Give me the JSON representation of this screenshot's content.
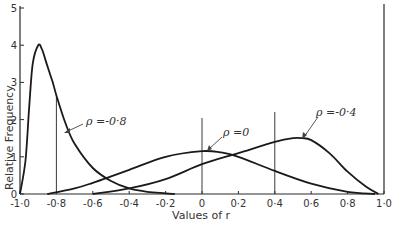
{
  "chart_data": {
    "type": "line",
    "title": "",
    "xlabel": "Values of r",
    "ylabel": "Relative  Frequency",
    "xlim": [
      -1.0,
      1.0
    ],
    "ylim": [
      0,
      5
    ],
    "grid": false,
    "legend": "none (curves annotated with arrows)",
    "x_ticks": [
      "-1·0",
      "-0·8",
      "-0·6",
      "-0·4",
      "-0·2",
      "0",
      "0·2",
      "0·4",
      "0·6",
      "0·8",
      "1·0"
    ],
    "y_ticks": [
      "0",
      "1",
      "2",
      "3",
      "4",
      "5"
    ],
    "vertical_markers": [
      -0.8,
      0.0,
      0.4
    ],
    "series": [
      {
        "name": "ρ = -0·8",
        "x": [
          -1.0,
          -0.97,
          -0.95,
          -0.93,
          -0.9,
          -0.88,
          -0.86,
          -0.84,
          -0.82,
          -0.8,
          -0.75,
          -0.7,
          -0.6,
          -0.5,
          -0.4,
          -0.3,
          -0.2,
          -0.15
        ],
        "y": [
          0.0,
          0.9,
          2.3,
          3.5,
          4.0,
          3.9,
          3.6,
          3.3,
          3.0,
          2.65,
          1.9,
          1.35,
          0.7,
          0.35,
          0.15,
          0.06,
          0.02,
          0.0
        ]
      },
      {
        "name": "ρ = 0",
        "x": [
          -0.85,
          -0.7,
          -0.6,
          -0.4,
          -0.2,
          0.0,
          0.1,
          0.2,
          0.4,
          0.6,
          0.8,
          0.95
        ],
        "y": [
          0.0,
          0.15,
          0.3,
          0.65,
          1.0,
          1.15,
          1.12,
          1.0,
          0.62,
          0.28,
          0.06,
          0.0
        ]
      },
      {
        "name": "ρ = -0·4",
        "x": [
          -0.6,
          -0.4,
          -0.2,
          0.0,
          0.2,
          0.4,
          0.5,
          0.55,
          0.6,
          0.7,
          0.8,
          0.9,
          0.97
        ],
        "y": [
          0.0,
          0.15,
          0.4,
          0.8,
          1.1,
          1.4,
          1.5,
          1.5,
          1.45,
          1.1,
          0.6,
          0.2,
          0.0
        ]
      }
    ],
    "annotations": [
      {
        "text": "ρ =-0·8",
        "points_to_series": "ρ = -0·8"
      },
      {
        "text": "ρ =0",
        "points_to_series": "ρ = 0"
      },
      {
        "text": "ρ =-0·4",
        "points_to_series": "ρ = -0·4"
      }
    ]
  },
  "labels": {
    "xlabel": "Values of r",
    "ylabel": "Relative  Frequency",
    "annot_m08": "ρ =-0·8",
    "annot_0": "ρ =0",
    "annot_m04": "ρ =-0·4"
  }
}
